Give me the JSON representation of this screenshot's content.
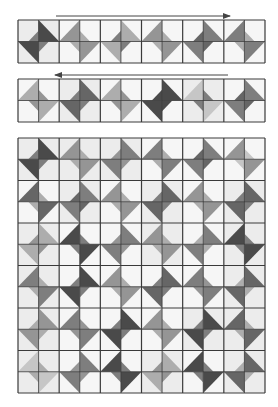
{
  "diagram": {
    "type": "quilt-assembly-diagram",
    "colors": {
      "background": "#ffffff",
      "grid_line": "#3a3a3a",
      "tones": {
        "bg1": "#ececec",
        "bg2": "#f6f6f6",
        "bg3": "#e2e2e2",
        "dark": "#4a4a4a",
        "med_dark": "#666666",
        "medium": "#7e7e7e",
        "med_light": "#959595",
        "light": "#adadad",
        "pale": "#c6c6c6"
      }
    },
    "strips": [
      {
        "name": "row-1",
        "arrow_direction": "right",
        "arrow": {
          "x1": 56,
          "x2": 230,
          "y": 16
        },
        "box": {
          "x": 18,
          "y": 20,
          "w": 247,
          "h": 43
        },
        "blocks": [
          {
            "variant": "A",
            "big": "dark",
            "small": "medium",
            "bg": "bg1"
          },
          {
            "variant": "B",
            "big": "med_light",
            "small": "light",
            "bg": "bg2"
          },
          {
            "variant": "A",
            "big": "light",
            "small": "medium",
            "bg": "bg2"
          },
          {
            "variant": "B",
            "big": "med_light",
            "small": "light",
            "bg": "bg2"
          },
          {
            "variant": "A",
            "big": "medium",
            "small": "med_dark",
            "bg": "bg2"
          },
          {
            "variant": "B",
            "big": "medium",
            "small": "light",
            "bg": "bg2"
          }
        ]
      },
      {
        "name": "row-2",
        "arrow_direction": "left",
        "arrow": {
          "x1": 55,
          "x2": 228,
          "y": 75
        },
        "box": {
          "x": 18,
          "y": 79,
          "w": 247,
          "h": 43
        },
        "blocks": [
          {
            "variant": "B",
            "big": "light",
            "small": "med_light",
            "bg": "bg2"
          },
          {
            "variant": "A",
            "big": "med_dark",
            "small": "medium",
            "bg": "bg1"
          },
          {
            "variant": "B",
            "big": "light",
            "small": "med_light",
            "bg": "bg2"
          },
          {
            "variant": "A",
            "big": "dark",
            "small": "dark",
            "bg": "bg2"
          },
          {
            "variant": "B",
            "big": "pale",
            "small": "medium",
            "bg": "bg1"
          },
          {
            "variant": "A",
            "big": "medium",
            "small": "med_dark",
            "bg": "bg2"
          }
        ]
      }
    ],
    "quilt": {
      "name": "assembled-quilt",
      "box": {
        "x": 18,
        "y": 138,
        "w": 247,
        "h": 255
      },
      "rows": [
        [
          {
            "variant": "A",
            "big": "dark",
            "small": "medium",
            "bg": "bg1"
          },
          {
            "variant": "B",
            "big": "med_light",
            "small": "light",
            "bg": "bg1"
          },
          {
            "variant": "A",
            "big": "medium",
            "small": "med_light",
            "bg": "bg1"
          },
          {
            "variant": "B",
            "big": "medium",
            "small": "light",
            "bg": "bg2"
          },
          {
            "variant": "A",
            "big": "medium",
            "small": "med_dark",
            "bg": "bg2"
          },
          {
            "variant": "B",
            "big": "med_light",
            "small": "pale",
            "bg": "bg2"
          }
        ],
        [
          {
            "variant": "B",
            "big": "med_dark",
            "small": "light",
            "bg": "bg2"
          },
          {
            "variant": "A",
            "big": "medium",
            "small": "med_dark",
            "bg": "bg1"
          },
          {
            "variant": "B",
            "big": "med_light",
            "small": "light",
            "bg": "bg2"
          },
          {
            "variant": "A",
            "big": "med_dark",
            "small": "medium",
            "bg": "bg1"
          },
          {
            "variant": "B",
            "big": "med_light",
            "small": "light",
            "bg": "bg2"
          },
          {
            "variant": "A",
            "big": "med_dark",
            "small": "medium",
            "bg": "bg1"
          }
        ],
        [
          {
            "variant": "A",
            "big": "light",
            "small": "med_light",
            "bg": "bg1"
          },
          {
            "variant": "B",
            "big": "dark",
            "small": "medium",
            "bg": "bg2"
          },
          {
            "variant": "A",
            "big": "medium",
            "small": "med_light",
            "bg": "bg2"
          },
          {
            "variant": "B",
            "big": "med_light",
            "small": "light",
            "bg": "bg1"
          },
          {
            "variant": "A",
            "big": "medium",
            "small": "light",
            "bg": "bg2"
          },
          {
            "variant": "B",
            "big": "dark",
            "small": "medium",
            "bg": "bg1"
          }
        ],
        [
          {
            "variant": "B",
            "big": "medium",
            "small": "light",
            "bg": "bg1"
          },
          {
            "variant": "A",
            "big": "dark",
            "small": "medium",
            "bg": "bg2"
          },
          {
            "variant": "B",
            "big": "med_light",
            "small": "light",
            "bg": "bg2"
          },
          {
            "variant": "A",
            "big": "med_dark",
            "small": "medium",
            "bg": "bg2"
          },
          {
            "variant": "B",
            "big": "medium",
            "small": "med_light",
            "bg": "bg2"
          },
          {
            "variant": "A",
            "big": "med_dark",
            "small": "light",
            "bg": "bg1"
          }
        ],
        [
          {
            "variant": "A",
            "big": "med_light",
            "small": "light",
            "bg": "bg1"
          },
          {
            "variant": "B",
            "big": "medium",
            "small": "med_light",
            "bg": "bg2"
          },
          {
            "variant": "A",
            "big": "dark",
            "small": "medium",
            "bg": "bg2"
          },
          {
            "variant": "B",
            "big": "med_light",
            "small": "light",
            "bg": "bg2"
          },
          {
            "variant": "A",
            "big": "dark",
            "small": "medium",
            "bg": "bg1"
          },
          {
            "variant": "B",
            "big": "med_dark",
            "small": "light",
            "bg": "bg1"
          }
        ],
        [
          {
            "variant": "B",
            "big": "pale",
            "small": "light",
            "bg": "bg1"
          },
          {
            "variant": "A",
            "big": "medium",
            "small": "med_light",
            "bg": "bg2"
          },
          {
            "variant": "B",
            "big": "dark",
            "small": "medium",
            "bg": "bg2"
          },
          {
            "variant": "A",
            "big": "light",
            "small": "med_light",
            "bg": "bg1"
          },
          {
            "variant": "B",
            "big": "dark",
            "small": "medium",
            "bg": "bg2"
          },
          {
            "variant": "A",
            "big": "med_dark",
            "small": "light",
            "bg": "bg1"
          }
        ]
      ]
    }
  }
}
